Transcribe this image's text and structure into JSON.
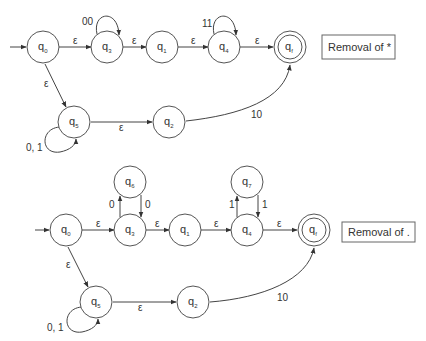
{
  "diagrams": [
    {
      "title": "Removal of *",
      "states": [
        {
          "id": "q0",
          "label": "q",
          "sub": "0",
          "x": 43,
          "y": 47,
          "start": true
        },
        {
          "id": "q3",
          "label": "q",
          "sub": "3",
          "x": 107,
          "y": 47
        },
        {
          "id": "q1",
          "label": "q",
          "sub": "1",
          "x": 162,
          "y": 47
        },
        {
          "id": "q4",
          "label": "q",
          "sub": "4",
          "x": 224,
          "y": 47
        },
        {
          "id": "qf",
          "label": "q",
          "sub": "f",
          "x": 290,
          "y": 47,
          "final": true
        },
        {
          "id": "q5",
          "label": "q",
          "sub": "5",
          "x": 74,
          "y": 122
        },
        {
          "id": "q2",
          "label": "q",
          "sub": "2",
          "x": 169,
          "y": 122
        }
      ],
      "transitions": [
        {
          "from": "q0",
          "to": "q3",
          "label": "ε"
        },
        {
          "from": "q3",
          "to": "q3",
          "label": "00"
        },
        {
          "from": "q3",
          "to": "q1",
          "label": "ε"
        },
        {
          "from": "q1",
          "to": "q4",
          "label": "ε"
        },
        {
          "from": "q4",
          "to": "q4",
          "label": "11"
        },
        {
          "from": "q4",
          "to": "qf",
          "label": "ε"
        },
        {
          "from": "q0",
          "to": "q5",
          "label": "ε"
        },
        {
          "from": "q5",
          "to": "q5",
          "label": "0, 1"
        },
        {
          "from": "q5",
          "to": "q2",
          "label": "ε"
        },
        {
          "from": "q2",
          "to": "qf",
          "label": "10"
        }
      ]
    },
    {
      "title": "Removal of .",
      "states": [
        {
          "id": "q0",
          "label": "q",
          "sub": "0",
          "x": 66,
          "y": 230,
          "start": true
        },
        {
          "id": "q3",
          "label": "q",
          "sub": "3",
          "x": 130,
          "y": 230
        },
        {
          "id": "q6",
          "label": "q",
          "sub": "6",
          "x": 130,
          "y": 182
        },
        {
          "id": "q1",
          "label": "q",
          "sub": "1",
          "x": 185,
          "y": 230
        },
        {
          "id": "q4",
          "label": "q",
          "sub": "4",
          "x": 247,
          "y": 230
        },
        {
          "id": "q7",
          "label": "q",
          "sub": "7",
          "x": 247,
          "y": 182
        },
        {
          "id": "qf",
          "label": "q",
          "sub": "f",
          "x": 314,
          "y": 230,
          "final": true
        },
        {
          "id": "q5",
          "label": "q",
          "sub": "5",
          "x": 96,
          "y": 302
        },
        {
          "id": "q2",
          "label": "q",
          "sub": "2",
          "x": 193,
          "y": 302
        }
      ],
      "transitions": [
        {
          "from": "q0",
          "to": "q3",
          "label": "ε"
        },
        {
          "from": "q3",
          "to": "q6",
          "label": "0"
        },
        {
          "from": "q6",
          "to": "q3",
          "label": "0"
        },
        {
          "from": "q3",
          "to": "q1",
          "label": "ε"
        },
        {
          "from": "q1",
          "to": "q4",
          "label": "ε"
        },
        {
          "from": "q4",
          "to": "q7",
          "label": "1"
        },
        {
          "from": "q7",
          "to": "q4",
          "label": "1"
        },
        {
          "from": "q4",
          "to": "qf",
          "label": "ε"
        },
        {
          "from": "q0",
          "to": "q5",
          "label": "ε"
        },
        {
          "from": "q5",
          "to": "q5",
          "label": "0, 1"
        },
        {
          "from": "q5",
          "to": "q2",
          "label": "ε"
        },
        {
          "from": "q2",
          "to": "qf",
          "label": "10"
        }
      ]
    }
  ],
  "labels": {
    "top_box": "Removal of *",
    "bottom_box": "Removal of .",
    "eps": "ε",
    "t_00": "00",
    "t_11": "11",
    "t_01": "0, 1",
    "t_10": "10",
    "t_0": "0",
    "t_1": "1",
    "q": "q",
    "s0": "0",
    "s1": "1",
    "s2": "2",
    "s3": "3",
    "s4": "4",
    "s5": "5",
    "s6": "6",
    "s7": "7",
    "sf": "f"
  }
}
